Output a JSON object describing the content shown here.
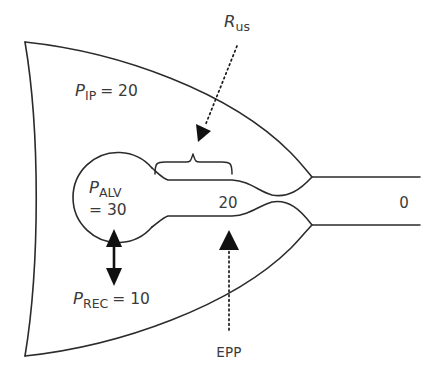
{
  "diagram": {
    "background_color": "#ffffff",
    "stroke_color": "#2b2b2b",
    "text_color": "#3a3a3a",
    "labels": {
      "upstream_resistance": {
        "symbol": "R",
        "subscript": "us",
        "name": "upstream-resistance-label"
      },
      "intrapleural_pressure": {
        "symbol": "P",
        "subscript": "IP",
        "value_text": "= 20",
        "value": 20,
        "name": "intrapleural-pressure-label"
      },
      "alveolar_pressure": {
        "symbol": "P",
        "subscript": "ALV",
        "value_text": "= 30",
        "value": 30,
        "name": "alveolar-pressure-label"
      },
      "recoil_pressure": {
        "symbol": "P",
        "subscript": "REC",
        "value_text": "= 10",
        "value": 10,
        "name": "recoil-pressure-label"
      },
      "airway_pressure_mid": {
        "text": "20",
        "value": 20,
        "name": "airway-pressure-midpoint"
      },
      "airway_pressure_mouth": {
        "text": "0",
        "value": 0,
        "name": "airway-pressure-mouth"
      },
      "equal_pressure_point": {
        "text": "EPP",
        "name": "equal-pressure-point-label"
      }
    },
    "annotations": {
      "brace": "upstream-segment-brace",
      "recoil_arrow": "recoil-double-arrow",
      "epp_pointer": "epp-dotted-pointer",
      "rus_pointer": "rus-dotted-pointer"
    }
  }
}
